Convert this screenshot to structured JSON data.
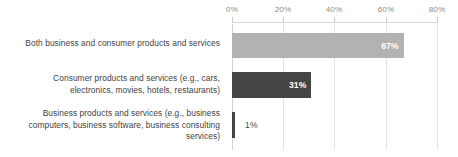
{
  "chart_data": {
    "type": "bar",
    "orientation": "horizontal",
    "title": "",
    "xlabel": "",
    "ylabel": "",
    "xlim": [
      0,
      80
    ],
    "grid": true,
    "legend": "none",
    "tick_labels": [
      "0%",
      "20%",
      "40%",
      "60%",
      "80%"
    ],
    "tick_values": [
      0,
      20,
      40,
      60,
      80
    ],
    "categories": [
      "Both business and consumer products and services",
      "Consumer products and services (e.g., cars, electronics, movies, hotels, restaurants)",
      "Business products and services (e.g., business computers, business software, business consulting services)"
    ],
    "values": [
      67,
      31,
      1
    ],
    "data_labels": [
      "67%",
      "31%",
      "1%"
    ],
    "colors": {
      "bar_0": "#b2b2b2",
      "bar_1": "#444444",
      "bar_2": "#444444",
      "gridline": "#e3e3e3",
      "axis": "#d8d8d8",
      "tick_text": "#8d8d8d",
      "category_text": "#3f3f3f",
      "label_inside_text": "#ffffff",
      "label_outside_text": "#4a4a4a"
    }
  },
  "categories_wrapped": [
    [
      "Both business and consumer products and services"
    ],
    [
      "Consumer products and services (e.g., cars,",
      "electronics, movies, hotels, restaurants)"
    ],
    [
      "Business products and services (e.g., business",
      "computers, business software, business consulting",
      "services)"
    ]
  ],
  "cat0_line0": "Both business and consumer products and services",
  "cat1_line0": "Consumer products and services (e.g., cars,",
  "cat1_line1": "electronics, movies, hotels, restaurants)",
  "cat2_line0": "Business products and services (e.g., business",
  "cat2_line1": "computers, business software, business consulting",
  "cat2_line2": "services)",
  "tick0": "0%",
  "tick1": "20%",
  "tick2": "40%",
  "tick3": "60%",
  "tick4": "80%",
  "value0": "67%",
  "value1": "31%",
  "value2": "1%"
}
